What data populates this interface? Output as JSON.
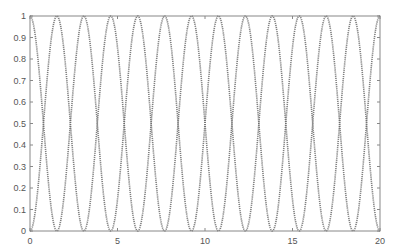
{
  "chart_data": {
    "type": "line",
    "title": "",
    "xlabel": "",
    "ylabel": "",
    "xlim": [
      0,
      20
    ],
    "ylim": [
      0,
      1
    ],
    "grid": false,
    "legend": null,
    "x_ticks": [
      0,
      5,
      10,
      15,
      20
    ],
    "x_tick_labels": [
      "0",
      "5",
      "10",
      "15",
      "20"
    ],
    "y_ticks": [
      0,
      0.1,
      0.2,
      0.3,
      0.4,
      0.5,
      0.6,
      0.7,
      0.8,
      0.9,
      1
    ],
    "y_tick_labels": [
      "0",
      "0.1",
      "0.2",
      "0.3",
      "0.4",
      "0.5",
      "0.6",
      "0.7",
      "0.8",
      "0.9",
      "1"
    ],
    "series": [
      {
        "name": "curve 1 (starts at 1)",
        "formula": "cos^2(13*pi*x/40)",
        "style": "dotted",
        "color": "#6a6a6a",
        "x": [
          0,
          1.538,
          3.077,
          4.615,
          6.154,
          7.692,
          9.231,
          10.769,
          12.308,
          13.846,
          15.385,
          16.923,
          18.462,
          20
        ],
        "values": [
          1,
          0,
          1,
          0,
          1,
          0,
          1,
          0,
          1,
          0,
          1,
          0,
          1,
          0
        ]
      },
      {
        "name": "curve 2 (starts at 0)",
        "formula": "sin^2(13*pi*x/40)",
        "style": "dotted",
        "color": "#6a6a6a",
        "x": [
          0,
          1.538,
          3.077,
          4.615,
          6.154,
          7.692,
          9.231,
          10.769,
          12.308,
          13.846,
          15.385,
          16.923,
          18.462,
          20
        ],
        "values": [
          0,
          1,
          0,
          1,
          0,
          1,
          0,
          1,
          0,
          1,
          0,
          1,
          0,
          1
        ]
      }
    ],
    "crossings_y": 0.5,
    "half_periods": 13
  },
  "colors": {
    "axis": "#888888",
    "line": "#6a6a6a",
    "background": "#ffffff"
  }
}
